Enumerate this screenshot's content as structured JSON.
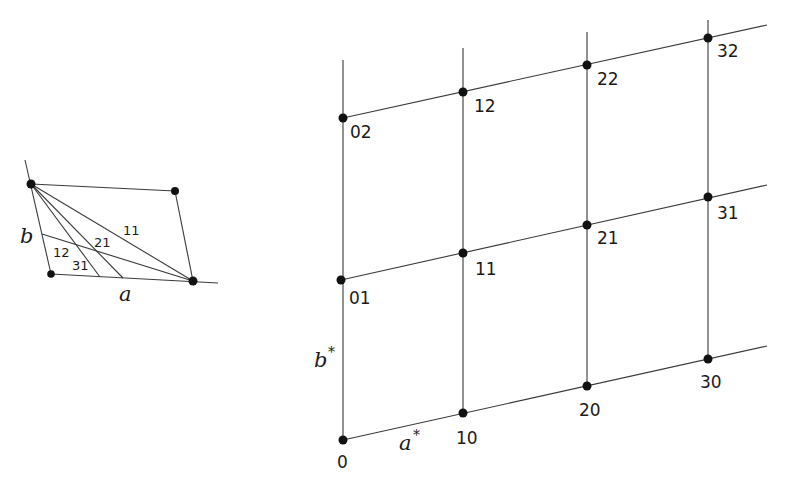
{
  "direct_cell": {
    "axis_a_label": "a",
    "axis_b_label": "b",
    "plane_labels": [
      "11",
      "21",
      "12",
      "31"
    ]
  },
  "reciprocal_lattice": {
    "axis_a_label": "a",
    "axis_b_label": "b",
    "star": "*",
    "points": [
      {
        "label": "0"
      },
      {
        "label": "10"
      },
      {
        "label": "20"
      },
      {
        "label": "30"
      },
      {
        "label": "01"
      },
      {
        "label": "11"
      },
      {
        "label": "21"
      },
      {
        "label": "31"
      },
      {
        "label": "02"
      },
      {
        "label": "12"
      },
      {
        "label": "22"
      },
      {
        "label": "32"
      }
    ]
  }
}
